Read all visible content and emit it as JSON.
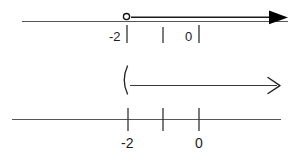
{
  "diagram": {
    "stroke_colors": {
      "axis": "#565656",
      "ray": "#1a1a1a",
      "tick": "#2b2b2b",
      "label": "#1c1c1c",
      "arrowhead": "#000000",
      "background": "#ffffff"
    },
    "figures": [
      {
        "id": "figure-top",
        "name": "number-line-open-circle-ray",
        "endpoint_type": "open-circle",
        "endpoint_value": "-2",
        "direction": "right",
        "arrowhead": "solid",
        "labels": [
          {
            "text": "-2",
            "x": 109,
            "y": 30
          },
          {
            "text": "0",
            "x": 185,
            "y": 30
          }
        ],
        "ticks": [
          {
            "value": "-2",
            "x": 127
          },
          {
            "value": "-1",
            "x": 163
          },
          {
            "value": "0",
            "x": 199
          }
        ]
      },
      {
        "id": "figure-middle",
        "name": "interval-parenthesis-ray",
        "endpoint_type": "parenthesis",
        "endpoint_symbol": "(",
        "endpoint_value": "-2",
        "direction": "right",
        "arrowhead": "open",
        "labels": [],
        "ticks": []
      },
      {
        "id": "figure-bottom",
        "name": "plain-number-line",
        "endpoint_type": "none",
        "direction": "none",
        "arrowhead": "none",
        "labels": [
          {
            "text": "-2",
            "x": 121,
            "y": 144
          },
          {
            "text": "0",
            "x": 195,
            "y": 144
          }
        ],
        "ticks": [
          {
            "value": "-2",
            "x": 128
          },
          {
            "value": "-1",
            "x": 163
          },
          {
            "value": "0",
            "x": 199
          }
        ]
      }
    ]
  }
}
